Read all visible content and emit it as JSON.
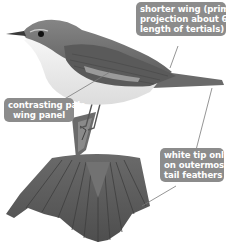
{
  "figure": {
    "colors": {
      "callout_bg": "#8c8c8c",
      "callout_text": "#ffffff",
      "leader_line": "#7a7a7a",
      "bird_upperparts": "#6e6e6e",
      "bird_underparts": "#f2f2f2",
      "tail_fan": "#5e5e5e"
    }
  },
  "callouts": {
    "wing": {
      "lines": [
        "shorter wing (primary",
        "projection about 60%",
        "length of tertials)"
      ]
    },
    "panel": {
      "lines": [
        "contrasting pale",
        "wing panel"
      ]
    },
    "tail": {
      "lines": [
        "white tip only",
        "on outermost",
        "tail feathers"
      ]
    }
  }
}
